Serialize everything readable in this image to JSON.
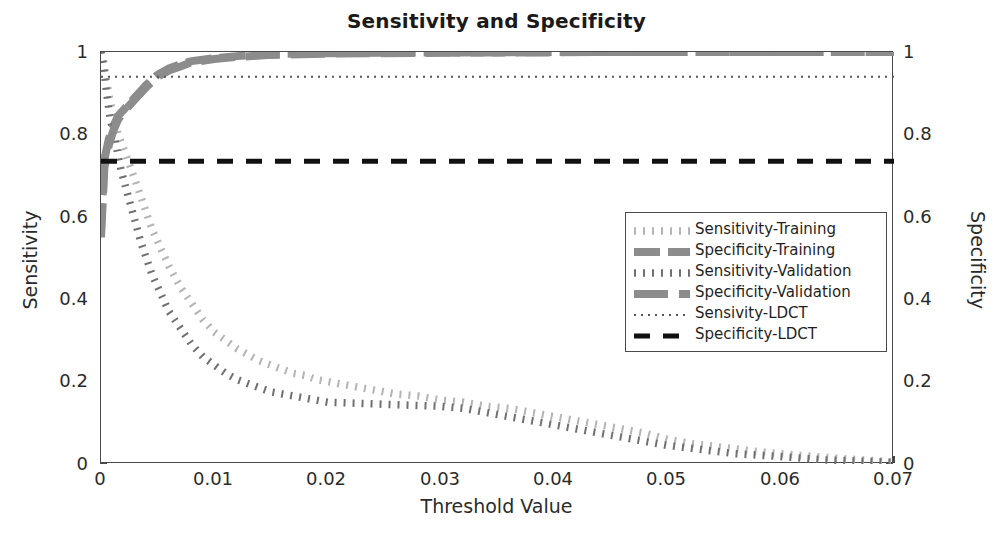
{
  "chart_data": {
    "type": "line",
    "title": "Sensitivity and Specificity",
    "xlabel": "Threshold Value",
    "ylabel": "Sensitivity",
    "ylabel_right": "Specificity",
    "xlim": [
      0,
      0.07
    ],
    "ylim": [
      0,
      1
    ],
    "ylim_right": [
      0,
      1
    ],
    "grid": false,
    "legend_position": "center-right",
    "xticks": [
      "0",
      "0.01",
      "0.02",
      "0.03",
      "0.04",
      "0.05",
      "0.06",
      "0.07"
    ],
    "xtick_values": [
      0,
      0.01,
      0.02,
      0.03,
      0.04,
      0.05,
      0.06,
      0.07
    ],
    "yticks": [
      "0",
      "0.2",
      "0.4",
      "0.6",
      "0.8",
      "1"
    ],
    "ytick_values": [
      0,
      0.2,
      0.4,
      0.6,
      0.8,
      1
    ],
    "yticks_right": [
      "0",
      "0.2",
      "0.4",
      "0.6",
      "0.8",
      "1"
    ],
    "ytick_values_right": [
      0,
      0.2,
      0.4,
      0.6,
      0.8,
      1
    ],
    "series": [
      {
        "name": "Sensitivity-Training",
        "color": "#b4b4b4",
        "style": "dotted-square",
        "axis": "left",
        "x": [
          0,
          0.0002,
          0.0005,
          0.0008,
          0.0012,
          0.0015,
          0.0018,
          0.0022,
          0.0026,
          0.003,
          0.0035,
          0.004,
          0.0045,
          0.005,
          0.006,
          0.007,
          0.008,
          0.009,
          0.01,
          0.011,
          0.012,
          0.013,
          0.014,
          0.015,
          0.016,
          0.017,
          0.018,
          0.019,
          0.02,
          0.022,
          0.024,
          0.026,
          0.028,
          0.03,
          0.032,
          0.034,
          0.036,
          0.038,
          0.04,
          0.042,
          0.044,
          0.046,
          0.048,
          0.05,
          0.052,
          0.055,
          0.058,
          0.06,
          0.063,
          0.066,
          0.07
        ],
        "y": [
          1.0,
          0.98,
          0.93,
          0.88,
          0.84,
          0.8,
          0.78,
          0.75,
          0.72,
          0.69,
          0.65,
          0.61,
          0.57,
          0.54,
          0.48,
          0.43,
          0.39,
          0.35,
          0.32,
          0.3,
          0.28,
          0.265,
          0.25,
          0.24,
          0.23,
          0.22,
          0.215,
          0.205,
          0.2,
          0.19,
          0.18,
          0.17,
          0.165,
          0.155,
          0.15,
          0.14,
          0.135,
          0.125,
          0.115,
          0.105,
          0.095,
          0.085,
          0.075,
          0.06,
          0.05,
          0.04,
          0.03,
          0.025,
          0.018,
          0.012,
          0.005
        ]
      },
      {
        "name": "Specificity-Training",
        "color": "#8c8c8c",
        "style": "dashed-thick",
        "axis": "right",
        "x": [
          0,
          0.0003,
          0.0007,
          0.0011,
          0.0015,
          0.002,
          0.0025,
          0.003,
          0.0035,
          0.004,
          0.005,
          0.006,
          0.007,
          0.008,
          0.01,
          0.012,
          0.015,
          0.02,
          0.025,
          0.03,
          0.035,
          0.04,
          0.045,
          0.05,
          0.055,
          0.06,
          0.065,
          0.07
        ],
        "y": [
          0.57,
          0.74,
          0.79,
          0.82,
          0.845,
          0.86,
          0.875,
          0.89,
          0.905,
          0.92,
          0.945,
          0.96,
          0.97,
          0.978,
          0.985,
          0.99,
          0.995,
          0.997,
          0.998,
          0.999,
          0.999,
          1.0,
          1.0,
          1.0,
          1.0,
          1.0,
          1.0,
          1.0
        ]
      },
      {
        "name": "Sensitivity-Validation",
        "color": "#707070",
        "style": "dotted-square",
        "axis": "left",
        "x": [
          0,
          0.0002,
          0.0005,
          0.0008,
          0.0012,
          0.0015,
          0.0018,
          0.0022,
          0.0026,
          0.003,
          0.0035,
          0.004,
          0.0045,
          0.005,
          0.006,
          0.007,
          0.008,
          0.009,
          0.01,
          0.011,
          0.012,
          0.013,
          0.014,
          0.015,
          0.016,
          0.017,
          0.018,
          0.019,
          0.02,
          0.022,
          0.024,
          0.026,
          0.028,
          0.03,
          0.032,
          0.034,
          0.036,
          0.038,
          0.04,
          0.042,
          0.044,
          0.046,
          0.048,
          0.05,
          0.053,
          0.056,
          0.06,
          0.064,
          0.07
        ],
        "y": [
          1.0,
          0.97,
          0.9,
          0.84,
          0.79,
          0.75,
          0.71,
          0.67,
          0.63,
          0.59,
          0.54,
          0.5,
          0.46,
          0.43,
          0.37,
          0.33,
          0.29,
          0.26,
          0.24,
          0.22,
          0.205,
          0.195,
          0.185,
          0.175,
          0.17,
          0.165,
          0.16,
          0.155,
          0.15,
          0.148,
          0.146,
          0.144,
          0.142,
          0.14,
          0.135,
          0.125,
          0.115,
          0.105,
          0.095,
          0.085,
          0.075,
          0.065,
          0.055,
          0.045,
          0.035,
          0.025,
          0.018,
          0.01,
          0.004
        ]
      },
      {
        "name": "Specificity-Validation",
        "color": "#8c8c8c",
        "style": "dashed-long",
        "axis": "right",
        "x": [
          0,
          0.0003,
          0.0007,
          0.0011,
          0.0015,
          0.002,
          0.0025,
          0.003,
          0.0035,
          0.004,
          0.005,
          0.006,
          0.007,
          0.008,
          0.01,
          0.012,
          0.015,
          0.02,
          0.025,
          0.03,
          0.035,
          0.04,
          0.045,
          0.05,
          0.055,
          0.06,
          0.065,
          0.07
        ],
        "y": [
          0.55,
          0.72,
          0.775,
          0.81,
          0.835,
          0.855,
          0.87,
          0.885,
          0.9,
          0.915,
          0.94,
          0.955,
          0.965,
          0.975,
          0.983,
          0.988,
          0.993,
          0.996,
          0.997,
          0.998,
          0.999,
          0.999,
          1.0,
          1.0,
          1.0,
          1.0,
          1.0,
          1.0
        ]
      },
      {
        "name": "Sensivity-LDCT",
        "color": "#555555",
        "style": "fine-dotted",
        "axis": "left",
        "constant": 0.94,
        "x": [
          0,
          0.07
        ],
        "y": [
          0.94,
          0.94
        ]
      },
      {
        "name": "Specificity-LDCT",
        "color": "#111111",
        "style": "dashed-black",
        "axis": "right",
        "constant": 0.735,
        "x": [
          0,
          0.07
        ],
        "y": [
          0.735,
          0.735
        ]
      }
    ]
  },
  "legend": {
    "items": [
      {
        "label": "Sensitivity-Training"
      },
      {
        "label": "Specificity-Training"
      },
      {
        "label": "Sensitivity-Validation"
      },
      {
        "label": "Specificity-Validation"
      },
      {
        "label": "Sensivity-LDCT"
      },
      {
        "label": "Specificity-LDCT"
      }
    ]
  }
}
